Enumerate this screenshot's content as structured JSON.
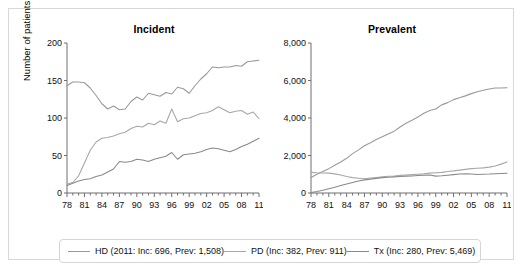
{
  "figure": {
    "y_axis_label": "Number of patients"
  },
  "legend": {
    "entries": [
      {
        "key": "HD",
        "label": "HD (2011: Inc: 696, Prev: 1,508)",
        "color": "#9a9a9a"
      },
      {
        "key": "PD",
        "label": "PD (Inc: 382, Prev: 911)",
        "color": "#a8a8a8"
      },
      {
        "key": "Tx",
        "label": "Tx (Inc: 280, Prev: 5,469)",
        "color": "#8a8a8a"
      }
    ]
  },
  "chart_data": [
    {
      "type": "line",
      "title": "Incident",
      "xlabel": "",
      "ylabel": "Number of patients",
      "xlim": [
        1978,
        2011
      ],
      "ylim": [
        0,
        200
      ],
      "yticks": [
        0,
        50,
        100,
        150,
        200
      ],
      "ytick_labels": [
        "0",
        "50",
        "100",
        "150",
        "200"
      ],
      "xticks": [
        1978,
        1981,
        1984,
        1987,
        1990,
        1993,
        1996,
        1999,
        2002,
        2005,
        2008,
        2011
      ],
      "xtick_labels": [
        "78",
        "81",
        "84",
        "87",
        "90",
        "93",
        "96",
        "99",
        "02",
        "05",
        "08",
        "11"
      ],
      "grid": false,
      "legend_position": "below-figure",
      "x": [
        1978,
        1979,
        1980,
        1981,
        1982,
        1983,
        1984,
        1985,
        1986,
        1987,
        1988,
        1989,
        1990,
        1991,
        1992,
        1993,
        1994,
        1995,
        1996,
        1997,
        1998,
        1999,
        2000,
        2001,
        2002,
        2003,
        2004,
        2005,
        2006,
        2007,
        2008,
        2009,
        2010,
        2011
      ],
      "series": [
        {
          "name": "HD",
          "color": "#9a9a9a",
          "values": [
            143,
            148,
            148,
            147,
            140,
            130,
            119,
            112,
            116,
            111,
            112,
            122,
            128,
            124,
            133,
            131,
            129,
            134,
            132,
            141,
            139,
            133,
            143,
            152,
            159,
            168,
            167,
            168,
            168,
            170,
            169,
            175,
            176,
            177
          ]
        },
        {
          "name": "PD",
          "color": "#a8a8a8",
          "values": [
            12,
            14,
            23,
            40,
            57,
            68,
            73,
            74,
            76,
            79,
            81,
            86,
            89,
            88,
            93,
            91,
            96,
            93,
            112,
            95,
            99,
            100,
            103,
            106,
            107,
            110,
            115,
            111,
            107,
            109,
            110,
            105,
            108,
            99
          ]
        },
        {
          "name": "Tx",
          "color": "#8a8a8a",
          "values": [
            10,
            13,
            16,
            18,
            19,
            22,
            24,
            28,
            32,
            42,
            41,
            42,
            45,
            44,
            42,
            45,
            47,
            49,
            54,
            45,
            51,
            52,
            53,
            55,
            58,
            60,
            59,
            57,
            55,
            58,
            62,
            65,
            69,
            73
          ]
        }
      ]
    },
    {
      "type": "line",
      "title": "Prevalent",
      "xlabel": "",
      "ylabel": "",
      "xlim": [
        1978,
        2011
      ],
      "ylim": [
        0,
        8000
      ],
      "yticks": [
        0,
        2000,
        4000,
        6000,
        8000
      ],
      "ytick_labels": [
        "0",
        "2,000",
        "4,000",
        "6,000",
        "8,000"
      ],
      "xticks": [
        1978,
        1981,
        1984,
        1987,
        1990,
        1993,
        1996,
        1999,
        2002,
        2005,
        2008,
        2011
      ],
      "xtick_labels": [
        "78",
        "81",
        "84",
        "87",
        "90",
        "93",
        "96",
        "99",
        "02",
        "05",
        "08",
        "11"
      ],
      "grid": false,
      "legend_position": "below-figure",
      "x": [
        1978,
        1979,
        1980,
        1981,
        1982,
        1983,
        1984,
        1985,
        1986,
        1987,
        1988,
        1989,
        1990,
        1991,
        1992,
        1993,
        1994,
        1995,
        1996,
        1997,
        1998,
        1999,
        2000,
        2001,
        2002,
        2003,
        2004,
        2005,
        2006,
        2007,
        2008,
        2009,
        2010,
        2011
      ],
      "series": [
        {
          "name": "HD",
          "color": "#9a9a9a",
          "values": [
            830,
            1000,
            1150,
            1300,
            1480,
            1650,
            1850,
            2100,
            2300,
            2520,
            2680,
            2850,
            3000,
            3150,
            3300,
            3520,
            3720,
            3880,
            4050,
            4250,
            4400,
            4480,
            4700,
            4820,
            4980,
            5080,
            5180,
            5300,
            5400,
            5480,
            5550,
            5600,
            5600,
            5610
          ]
        },
        {
          "name": "PD",
          "color": "#a8a8a8",
          "values": [
            1100,
            1080,
            1070,
            1060,
            1020,
            960,
            880,
            820,
            790,
            760,
            800,
            830,
            860,
            890,
            910,
            940,
            960,
            980,
            1000,
            1020,
            1060,
            1080,
            1100,
            1150,
            1180,
            1220,
            1260,
            1300,
            1320,
            1340,
            1380,
            1440,
            1540,
            1650
          ]
        },
        {
          "name": "Tx",
          "color": "#8a8a8a",
          "values": [
            20,
            80,
            150,
            230,
            310,
            400,
            480,
            560,
            640,
            700,
            740,
            780,
            820,
            840,
            860,
            880,
            900,
            910,
            930,
            950,
            960,
            900,
            920,
            950,
            980,
            1010,
            1030,
            1010,
            990,
            1000,
            1010,
            1030,
            1040,
            1050
          ]
        }
      ]
    }
  ]
}
